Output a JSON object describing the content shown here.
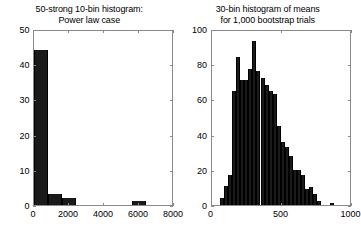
{
  "figure": {
    "background": "#ffffff",
    "bar_color": "#1a1a1a",
    "axis_color": "#8a8a8a"
  },
  "chart_data": [
    {
      "type": "bar",
      "id": "left-histogram",
      "title": "50-strong 10-bin histogram:\nPower law case",
      "title_line1": "50-strong 10-bin histogram:",
      "title_line2": "Power law case",
      "xlabel": "",
      "ylabel": "",
      "xlim": [
        0,
        8000
      ],
      "ylim": [
        0,
        50
      ],
      "xticks": [
        0,
        2000,
        4000,
        6000,
        8000
      ],
      "xtick_labels": [
        "0",
        "2000",
        "4000",
        "6000",
        "8000"
      ],
      "yticks": [
        0,
        10,
        20,
        30,
        40,
        50
      ],
      "ytick_labels": [
        "0",
        "10",
        "20",
        "30",
        "40",
        "50"
      ],
      "grid": false,
      "legend": null,
      "bin_count": 10,
      "bin_width": 800,
      "bin_edges": [
        0,
        800,
        1600,
        2400,
        3200,
        4000,
        4800,
        5600,
        6400,
        7200,
        8000
      ],
      "bin_centers": [
        400,
        1200,
        2000,
        2800,
        3600,
        4400,
        5200,
        6000,
        6800,
        7600
      ],
      "values": [
        44,
        3,
        2,
        0,
        0,
        0,
        0,
        1,
        0,
        0
      ]
    },
    {
      "type": "bar",
      "id": "right-histogram",
      "title": "30-bin histogram of means\nfor 1,000 bootstrap trials",
      "title_line1": "30-bin histogram of means",
      "title_line2": "for 1,000 bootstrap trials",
      "xlabel": "",
      "ylabel": "",
      "xlim": [
        0,
        1000
      ],
      "ylim": [
        0,
        100
      ],
      "xticks": [
        0,
        500,
        1000
      ],
      "xtick_labels": [
        "0",
        "500",
        "1000"
      ],
      "yticks": [
        0,
        20,
        40,
        60,
        80,
        100
      ],
      "ytick_labels": [
        "0",
        "20",
        "40",
        "60",
        "80",
        "100"
      ],
      "grid": false,
      "legend": null,
      "bin_count": 30,
      "bin_width": 29,
      "bin_edges": [
        60,
        89,
        118,
        147,
        176,
        205,
        234,
        263,
        292,
        321,
        350,
        379,
        408,
        437,
        466,
        495,
        524,
        553,
        582,
        611,
        640,
        669,
        698,
        727,
        756,
        785,
        814,
        843,
        872,
        901,
        930
      ],
      "bin_centers": [
        74,
        103,
        132,
        161,
        190,
        219,
        248,
        277,
        306,
        335,
        364,
        393,
        422,
        451,
        480,
        509,
        538,
        567,
        596,
        625,
        654,
        683,
        712,
        741,
        770,
        799,
        828,
        857,
        886,
        915
      ],
      "values": [
        4,
        11,
        17,
        65,
        84,
        71,
        71,
        77,
        93,
        76,
        72,
        68,
        65,
        63,
        45,
        36,
        33,
        28,
        20,
        20,
        17,
        9,
        10,
        6,
        2,
        0,
        0,
        1,
        0,
        0
      ]
    }
  ]
}
